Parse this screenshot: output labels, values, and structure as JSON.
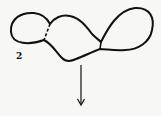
{
  "diagram": {
    "label": "2",
    "stroke_color": "#111111",
    "background": "#f7f7f5",
    "arrow_direction": "down"
  }
}
